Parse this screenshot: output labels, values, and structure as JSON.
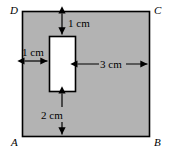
{
  "figure": {
    "colors": {
      "shaded_fill": "#b3b3b3",
      "hole_fill": "#ffffff",
      "stroke": "#000000",
      "background": "#ffffff"
    },
    "corner_labels": {
      "top_left": "D",
      "top_right": "C",
      "bottom_left": "A",
      "bottom_right": "B"
    },
    "dimensions": [
      {
        "id": "top-gap",
        "label": "1 cm",
        "orientation": "vertical"
      },
      {
        "id": "left-gap",
        "label": "1 cm",
        "orientation": "horizontal"
      },
      {
        "id": "right-gap",
        "label": "3 cm",
        "orientation": "horizontal"
      },
      {
        "id": "bottom-gap",
        "label": "2 cm",
        "orientation": "vertical"
      }
    ]
  }
}
